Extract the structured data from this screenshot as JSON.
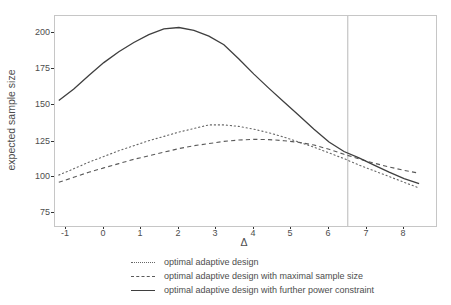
{
  "chart_data": {
    "type": "line",
    "title": "",
    "xlabel": "Δ",
    "ylabel": "expected sample size",
    "xlim": [
      -1.3,
      8.85
    ],
    "ylim": [
      66,
      212.5
    ],
    "xticks": [
      "-1",
      "0",
      "1",
      "2",
      "3",
      "4",
      "5",
      "6",
      "7",
      "8"
    ],
    "yticks": [
      "200",
      "175",
      "150",
      "125",
      "100",
      "75"
    ],
    "grid": "off",
    "legend_position": "bottom",
    "panel_border_color": "#c6c6c6",
    "tick_color": "#333333",
    "text_color": "#4d4d4d",
    "vline": {
      "x": 6.5,
      "color": "#b8b8b8"
    },
    "x": [
      -1.2,
      -0.8,
      -0.4,
      0,
      0.4,
      0.8,
      1.2,
      1.6,
      2,
      2.4,
      2.8,
      3.2,
      3.6,
      4,
      4.4,
      4.8,
      5.2,
      5.6,
      6,
      6.4,
      6.8,
      7.2,
      7.6,
      8,
      8.4
    ],
    "series": [
      {
        "name": "optimal adaptive design",
        "style": "dotted",
        "color": "#666666",
        "values": [
          101.5,
          106,
          110.5,
          114.5,
          118.5,
          122,
          125.5,
          128.5,
          131.5,
          134,
          136.5,
          136.5,
          135.5,
          133.5,
          131,
          128,
          124.5,
          121,
          117,
          113,
          108.5,
          104.5,
          100.5,
          96.5,
          92.5
        ]
      },
      {
        "name": "optimal adaptive design with maximal sample size",
        "style": "dashed",
        "color": "#5a5a5a",
        "values": [
          96.5,
          100,
          103.5,
          106.5,
          109.5,
          112.5,
          115,
          117.5,
          120,
          122,
          123.5,
          125,
          126,
          126.5,
          126.3,
          125.5,
          124.3,
          122.5,
          119.5,
          116,
          112.8,
          109.8,
          107.2,
          104.8,
          102.8
        ]
      },
      {
        "name": "optimal adaptive design with further power constraint",
        "style": "solid",
        "color": "#3f3f3f",
        "values": [
          153.5,
          161.5,
          171,
          180,
          187.5,
          194,
          199.5,
          203.5,
          204.5,
          202.5,
          198.5,
          192.5,
          182.5,
          172,
          162,
          152.5,
          143,
          133.5,
          124.5,
          118,
          113.5,
          108.5,
          103.5,
          99,
          95.5
        ]
      }
    ]
  }
}
